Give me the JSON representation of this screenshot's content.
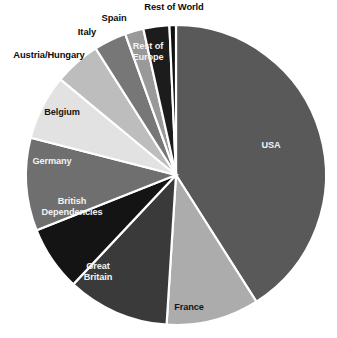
{
  "chart_data": {
    "type": "pie",
    "title": "",
    "subtitle": "",
    "xlabel": "",
    "ylabel": "",
    "legend_position": "none",
    "grid": false,
    "start_angle_deg": 0,
    "direction": "clockwise",
    "categories": [
      "USA",
      "France",
      "Great Britain",
      "British Dependencies",
      "Germany",
      "Belgium",
      "Austria/Hungary",
      "Italy",
      "Spain",
      "Rest of Europe",
      "Rest of World"
    ],
    "values": [
      41.0,
      10.0,
      11.0,
      7.0,
      10.0,
      7.0,
      5.0,
      3.5,
      2.0,
      2.8,
      0.7
    ],
    "slices": [
      {
        "label": "USA",
        "value": 41.0,
        "color": "#595959",
        "label_color": "#f2f2f2",
        "label_placement": "inside",
        "label_lines": "USA"
      },
      {
        "label": "France",
        "value": 10.0,
        "color": "#acacac",
        "label_color": "#161616",
        "label_placement": "inside",
        "label_lines": "France"
      },
      {
        "label": "Great Britain",
        "value": 11.0,
        "color": "#3a3a3a",
        "label_color": "#f2f2f2",
        "label_placement": "inside",
        "label_lines": "Great\nBritain"
      },
      {
        "label": "British Dependencies",
        "value": 7.0,
        "color": "#141414",
        "label_color": "#f2f2f2",
        "label_placement": "inside",
        "label_lines": "British\nDependencies"
      },
      {
        "label": "Germany",
        "value": 10.0,
        "color": "#6f6f6f",
        "label_color": "#f2f2f2",
        "label_placement": "inside",
        "label_lines": "Germany"
      },
      {
        "label": "Belgium",
        "value": 7.0,
        "color": "#e2e2e2",
        "label_color": "#161616",
        "label_placement": "inside",
        "label_lines": "Belgium"
      },
      {
        "label": "Austria/Hungary",
        "value": 5.0,
        "color": "#bdbdbd",
        "label_color": "#0d0d0d",
        "label_placement": "outside",
        "label_lines": "Austria/Hungary"
      },
      {
        "label": "Italy",
        "value": 3.5,
        "color": "#777777",
        "label_color": "#0d0d0d",
        "label_placement": "outside",
        "label_lines": "Italy"
      },
      {
        "label": "Spain",
        "value": 2.0,
        "color": "#999999",
        "label_color": "#0d0d0d",
        "label_placement": "outside",
        "label_lines": "Spain"
      },
      {
        "label": "Rest of Europe",
        "value": 2.8,
        "color": "#1c1c1c",
        "label_color": "#f2f2f2",
        "label_placement": "inside",
        "label_lines": "Rest of\nEurope"
      },
      {
        "label": "Rest of World",
        "value": 0.7,
        "color": "#101010",
        "label_color": "#0d0d0d",
        "label_placement": "outside",
        "label_lines": "Rest of World"
      }
    ],
    "geometry": {
      "center_x": 176,
      "center_y": 175,
      "radius": 150,
      "slice_border_color": "#ffffff",
      "background": "#ffffff"
    }
  }
}
